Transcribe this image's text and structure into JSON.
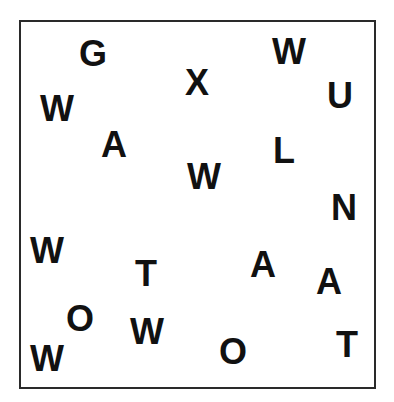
{
  "canvas": {
    "width": 394,
    "height": 402,
    "background": "#ffffff",
    "border_color": "#2a2a2a",
    "letter_color": "#111111"
  },
  "letters": [
    {
      "char": "G",
      "cx": 93,
      "cy": 54
    },
    {
      "char": "X",
      "cx": 197,
      "cy": 83
    },
    {
      "char": "W",
      "cx": 289,
      "cy": 52
    },
    {
      "char": "U",
      "cx": 340,
      "cy": 96
    },
    {
      "char": "W",
      "cx": 57,
      "cy": 109
    },
    {
      "char": "A",
      "cx": 114,
      "cy": 145
    },
    {
      "char": "L",
      "cx": 284,
      "cy": 151
    },
    {
      "char": "W",
      "cx": 204,
      "cy": 177
    },
    {
      "char": "N",
      "cx": 344,
      "cy": 208
    },
    {
      "char": "W",
      "cx": 47,
      "cy": 251
    },
    {
      "char": "T",
      "cx": 146,
      "cy": 274
    },
    {
      "char": "A",
      "cx": 263,
      "cy": 265
    },
    {
      "char": "A",
      "cx": 329,
      "cy": 282
    },
    {
      "char": "O",
      "cx": 80,
      "cy": 319
    },
    {
      "char": "W",
      "cx": 147,
      "cy": 332
    },
    {
      "char": "W",
      "cx": 47,
      "cy": 359
    },
    {
      "char": "O",
      "cx": 233,
      "cy": 352
    },
    {
      "char": "T",
      "cx": 347,
      "cy": 345
    }
  ]
}
